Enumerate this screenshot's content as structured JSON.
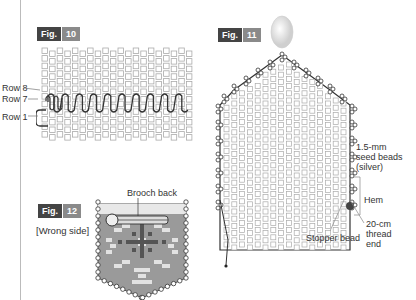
{
  "fig10": {
    "badge_word": "Fig.",
    "badge_num": "10",
    "labels": [
      "Row 8",
      "Row 7",
      "Row 1"
    ]
  },
  "fig11": {
    "badge_word": "Fig.",
    "badge_num": "11",
    "seed_beads": [
      "1.5-mm",
      "seed beads",
      "(silver)"
    ],
    "hem": "Hem",
    "thread_end": [
      "20-cm",
      "thread",
      "end"
    ],
    "stopper": "Stopper bead"
  },
  "fig12": {
    "badge_word": "Fig.",
    "badge_num": "12",
    "side_label": "[Wrong side]",
    "brooch_label": "Brooch back"
  },
  "colors": {
    "badge_dark": "#444444",
    "badge_light": "#8a8a8a",
    "bead_outline": "#999999",
    "pocket_fill": "#9a9a9a",
    "pattern_dark": "#555555",
    "pattern_light": "#e0e0e0"
  }
}
